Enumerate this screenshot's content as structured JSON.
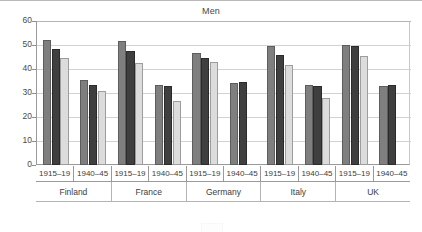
{
  "chart_data": {
    "type": "bar",
    "title": "Men",
    "xlabel": "",
    "ylabel": "",
    "ylim": [
      0,
      60
    ],
    "yticks": [
      0,
      10,
      20,
      30,
      40,
      50,
      60
    ],
    "grid": true,
    "legend_position": "bottom-cropped",
    "orientation": "vertical",
    "grouping": "grouped",
    "categories": [
      "Finland 1915–19",
      "Finland 1940–45",
      "France 1915–19",
      "France 1940–45",
      "Germany 1915–19",
      "Germany 1940–45",
      "Italy 1915–19",
      "Italy 1940–45",
      "UK 1915–19",
      "UK 1940–45"
    ],
    "countries": [
      "Finland",
      "France",
      "Germany",
      "Italy",
      "UK"
    ],
    "periods": [
      "1915–19",
      "1940–45"
    ],
    "series": [
      {
        "name": "series-1",
        "color": "#7f7f7f",
        "values": [
          52.2,
          35.5,
          51.5,
          33.5,
          46.5,
          34.2,
          49.5,
          33.5,
          50.0,
          33.0
        ]
      },
      {
        "name": "series-2",
        "color": "#3f3f3f",
        "values": [
          48.2,
          33.3,
          47.3,
          33.0,
          44.5,
          34.5,
          46.0,
          32.8,
          49.5,
          33.5
        ]
      },
      {
        "name": "series-3",
        "color": "#dcdcdc",
        "values": [
          44.5,
          30.8,
          42.5,
          26.8,
          42.8,
          null,
          41.5,
          27.8,
          45.5,
          null
        ]
      }
    ]
  },
  "axis": {
    "y_tick_labels": [
      "60",
      "50",
      "40",
      "30",
      "20",
      "10",
      "0"
    ],
    "period_labels": [
      "1915–19",
      "1940–45",
      "1915–19",
      "1940–45",
      "1915–19",
      "1940–45",
      "1915–19",
      "1940–45",
      "1915–19",
      "1940–45"
    ],
    "country_labels": [
      "Finland",
      "France",
      "Germany",
      "Italy",
      "UK"
    ]
  },
  "colors": {
    "series_1": "#7f7f7f",
    "series_2": "#3f3f3f",
    "series_3": "#dcdcdc",
    "axis": "#9a9a9a",
    "grid": "#d2d2d2",
    "text": "#3c3c3c",
    "background": "#ffffff"
  }
}
